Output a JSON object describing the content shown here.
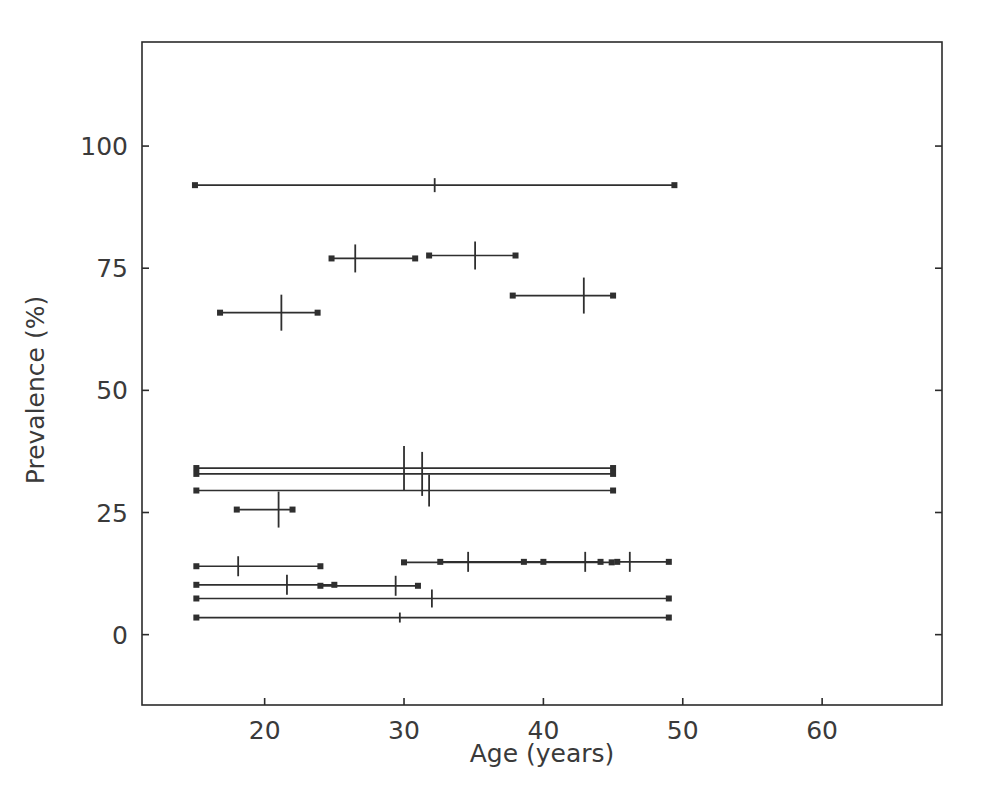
{
  "chart_data": {
    "type": "scatter",
    "title": "",
    "subtitle": "",
    "xlabel": "Age (years)",
    "ylabel": "Prevalence (%)",
    "xlim": [
      11.2,
      68.6
    ],
    "ylim": [
      -14.4,
      121.3
    ],
    "xticks": [
      20,
      30,
      40,
      50,
      60
    ],
    "xticklabels": [
      "20",
      "30",
      "40",
      "50",
      "60"
    ],
    "yticks": [
      0,
      25,
      50,
      75,
      100
    ],
    "yticklabels": [
      "0",
      "25",
      "50",
      "75",
      "100"
    ],
    "grid": false,
    "legend": null,
    "marker_style": "horizontal-interval-with-vertical-estimate-tick",
    "series_name": "study prevalence estimates by age range",
    "points": [
      {
        "age_low": 15.0,
        "age_high": 49.4,
        "age_mid": 32.2,
        "prevalence": 92.0,
        "has_vertical_tick": true,
        "vtick_half_height": 7
      },
      {
        "age_low": 24.8,
        "age_high": 30.8,
        "age_mid": 26.5,
        "prevalence": 77.0,
        "has_vertical_tick": true,
        "vtick_half_height": 14
      },
      {
        "age_low": 31.8,
        "age_high": 38.0,
        "age_mid": 35.1,
        "prevalence": 77.6,
        "has_vertical_tick": true,
        "vtick_half_height": 14
      },
      {
        "age_low": 37.8,
        "age_high": 45.0,
        "age_mid": 42.9,
        "prevalence": 69.4,
        "has_vertical_tick": true,
        "vtick_half_height": 18
      },
      {
        "age_low": 16.8,
        "age_high": 23.8,
        "age_mid": 21.2,
        "prevalence": 65.9,
        "has_vertical_tick": true,
        "vtick_half_height": 18
      },
      {
        "age_low": 15.1,
        "age_high": 45.0,
        "age_mid": 30.0,
        "prevalence": 34.1,
        "has_vertical_tick": true,
        "vtick_half_height": 22
      },
      {
        "age_low": 15.1,
        "age_high": 45.0,
        "age_mid": 31.3,
        "prevalence": 32.9,
        "has_vertical_tick": true,
        "vtick_half_height": 22
      },
      {
        "age_low": 15.1,
        "age_high": 45.0,
        "age_mid": 31.8,
        "prevalence": 29.5,
        "has_vertical_tick": true,
        "vtick_half_height": 16
      },
      {
        "age_low": 18.0,
        "age_high": 22.0,
        "age_mid": 21.0,
        "prevalence": 25.6,
        "has_vertical_tick": true,
        "vtick_half_height": 18
      },
      {
        "age_low": 15.1,
        "age_high": 24.0,
        "age_mid": 18.1,
        "prevalence": 14.0,
        "has_vertical_tick": true,
        "vtick_half_height": 10
      },
      {
        "age_low": 30.0,
        "age_high": 44.9,
        "age_mid": 36.0,
        "prevalence": 14.8,
        "has_vertical_tick": false,
        "vtick_half_height": 0
      },
      {
        "age_low": 32.6,
        "age_high": 40.0,
        "age_mid": 34.6,
        "prevalence": 14.9,
        "has_vertical_tick": true,
        "vtick_half_height": 10
      },
      {
        "age_low": 38.6,
        "age_high": 44.1,
        "age_mid": 43.0,
        "prevalence": 14.9,
        "has_vertical_tick": true,
        "vtick_half_height": 10
      },
      {
        "age_low": 45.3,
        "age_high": 49.0,
        "age_mid": 46.2,
        "prevalence": 14.9,
        "has_vertical_tick": true,
        "vtick_half_height": 10
      },
      {
        "age_low": 15.1,
        "age_high": 25.0,
        "age_mid": 21.6,
        "prevalence": 10.2,
        "has_vertical_tick": true,
        "vtick_half_height": 10
      },
      {
        "age_low": 24.0,
        "age_high": 31.0,
        "age_mid": 29.4,
        "prevalence": 10.0,
        "has_vertical_tick": true,
        "vtick_half_height": 10
      },
      {
        "age_low": 15.1,
        "age_high": 49.0,
        "age_mid": 32.0,
        "prevalence": 7.4,
        "has_vertical_tick": true,
        "vtick_half_height": 9
      },
      {
        "age_low": 15.1,
        "age_high": 49.0,
        "age_mid": 29.7,
        "prevalence": 3.5,
        "has_vertical_tick": true,
        "vtick_half_height": 5
      }
    ]
  },
  "figure": {
    "x_axis_label": "Age (years)",
    "y_axis_label": "Prevalence (%)",
    "x_tick_labels": [
      "20",
      "30",
      "40",
      "50",
      "60"
    ],
    "y_tick_labels": [
      "0",
      "25",
      "50",
      "75",
      "100"
    ],
    "line_color": "#2f2f2f",
    "axis_color": "#2b2b2b",
    "background_color": "#ffffff"
  }
}
